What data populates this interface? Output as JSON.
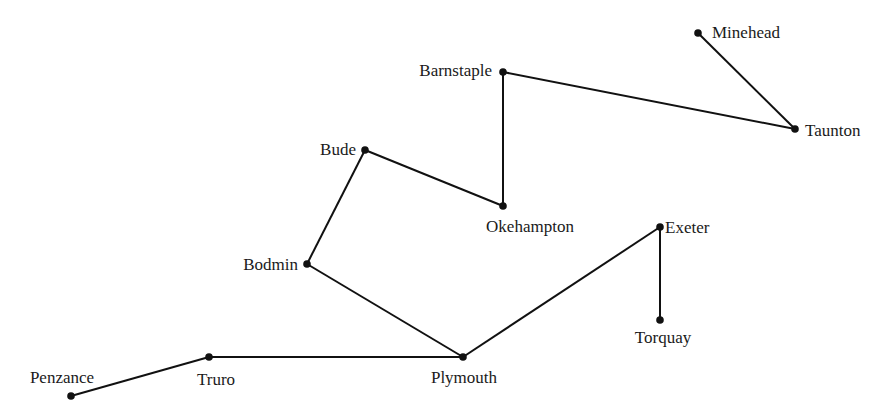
{
  "diagram": {
    "type": "network-graph",
    "nodes": [
      {
        "id": "minehead",
        "label": "Minehead",
        "x": 698,
        "y": 33,
        "lx": 712,
        "ly": 38,
        "anchor": "start"
      },
      {
        "id": "barnstaple",
        "label": "Barnstaple",
        "x": 503,
        "y": 72,
        "lx": 492,
        "ly": 76,
        "anchor": "end"
      },
      {
        "id": "taunton",
        "label": "Taunton",
        "x": 795,
        "y": 129,
        "lx": 805,
        "ly": 136,
        "anchor": "start"
      },
      {
        "id": "bude",
        "label": "Bude",
        "x": 365,
        "y": 150,
        "lx": 356,
        "ly": 155,
        "anchor": "end"
      },
      {
        "id": "okehampton",
        "label": "Okehampton",
        "x": 503,
        "y": 206,
        "lx": 530,
        "ly": 232,
        "anchor": "middle"
      },
      {
        "id": "exeter",
        "label": "Exeter",
        "x": 660,
        "y": 227,
        "lx": 665,
        "ly": 233,
        "anchor": "start"
      },
      {
        "id": "bodmin",
        "label": "Bodmin",
        "x": 307,
        "y": 264,
        "lx": 298,
        "ly": 270,
        "anchor": "end"
      },
      {
        "id": "torquay",
        "label": "Torquay",
        "x": 660,
        "y": 320,
        "lx": 663,
        "ly": 343,
        "anchor": "middle"
      },
      {
        "id": "plymouth",
        "label": "Plymouth",
        "x": 463,
        "y": 357,
        "lx": 464,
        "ly": 383,
        "anchor": "middle"
      },
      {
        "id": "truro",
        "label": "Truro",
        "x": 209,
        "y": 357,
        "lx": 216,
        "ly": 385,
        "anchor": "middle"
      },
      {
        "id": "penzance",
        "label": "Penzance",
        "x": 71,
        "y": 396,
        "lx": 62,
        "ly": 383,
        "anchor": "middle"
      }
    ],
    "edges": [
      {
        "from": "minehead",
        "to": "taunton"
      },
      {
        "from": "taunton",
        "to": "barnstaple"
      },
      {
        "from": "barnstaple",
        "to": "okehampton"
      },
      {
        "from": "okehampton",
        "to": "bude"
      },
      {
        "from": "bude",
        "to": "bodmin"
      },
      {
        "from": "bodmin",
        "to": "plymouth"
      },
      {
        "from": "plymouth",
        "to": "exeter"
      },
      {
        "from": "exeter",
        "to": "torquay"
      },
      {
        "from": "plymouth",
        "to": "truro"
      },
      {
        "from": "truro",
        "to": "penzance"
      }
    ],
    "colors": {
      "line": "#111111",
      "node": "#111111",
      "text": "#1a1a1a",
      "background": "#ffffff"
    }
  }
}
